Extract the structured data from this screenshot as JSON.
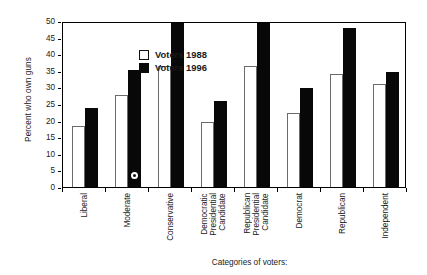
{
  "chart_data": {
    "type": "bar",
    "title": "",
    "xlabel": "Categories of voters:",
    "ylabel": "Percent who own guns",
    "ylim": [
      0,
      50
    ],
    "yticks": [
      0,
      5,
      10,
      15,
      20,
      25,
      30,
      35,
      40,
      45,
      50
    ],
    "grid": false,
    "legend_position": "top-left-inside",
    "categories": [
      "Liberal",
      "Moderate",
      "Conservative",
      "Democratic Presidential Candidate",
      "Republican Presidential Candidate",
      "Democrat",
      "Republican",
      "Independent"
    ],
    "category_lines": [
      [
        "Liberal"
      ],
      [
        "Moderate"
      ],
      [
        "Conservative"
      ],
      [
        "Democratic",
        "Presidential",
        "Candidate"
      ],
      [
        "Republican",
        "Presidential",
        "Candidate"
      ],
      [
        "Democrat"
      ],
      [
        "Republican"
      ],
      [
        "Independent"
      ]
    ],
    "series": [
      {
        "name": "Voters 1988",
        "style": "open",
        "color": "#ffffff",
        "edge_color": "#6b6b6b",
        "values": [
          18.3,
          27.6,
          36.4,
          19.7,
          36.3,
          22.2,
          34.1,
          30.9
        ]
      },
      {
        "name": "Voters 1996",
        "style": "filled",
        "color": "#080808",
        "edge_color": "#080808",
        "values": [
          23.7,
          35.2,
          49.3,
          25.8,
          49.5,
          29.8,
          47.8,
          34.5
        ]
      }
    ],
    "annotations": [
      {
        "name": "scan-blemish-marker",
        "shape": "circle",
        "category": "Moderate",
        "series": "Voters 1996",
        "value": 3.4
      }
    ]
  },
  "legend": {
    "items": [
      {
        "label": "Voters 1988",
        "style": "open"
      },
      {
        "label": "Voters 1996",
        "style": "filled"
      }
    ]
  }
}
